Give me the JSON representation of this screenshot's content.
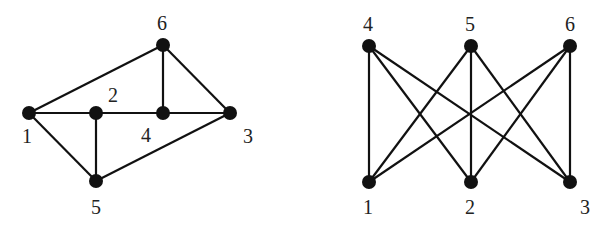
{
  "graphs": [
    {
      "id": "left",
      "nodes": [
        {
          "id": "1",
          "label": "1",
          "x": 29,
          "y": 113,
          "lx": 22,
          "ly": 143
        },
        {
          "id": "2",
          "label": "2",
          "x": 96,
          "y": 113,
          "lx": 108,
          "ly": 102
        },
        {
          "id": "3",
          "label": "3",
          "x": 230,
          "y": 113,
          "lx": 243,
          "ly": 143
        },
        {
          "id": "4",
          "label": "4",
          "x": 163,
          "y": 113,
          "lx": 141,
          "ly": 142
        },
        {
          "id": "5",
          "label": "5",
          "x": 96,
          "y": 181,
          "lx": 91,
          "ly": 214
        },
        {
          "id": "6",
          "label": "6",
          "x": 163,
          "y": 45,
          "lx": 157,
          "ly": 30
        }
      ],
      "edges": [
        [
          "1",
          "6"
        ],
        [
          "1",
          "2"
        ],
        [
          "2",
          "4"
        ],
        [
          "4",
          "3"
        ],
        [
          "6",
          "4"
        ],
        [
          "6",
          "3"
        ],
        [
          "1",
          "5"
        ],
        [
          "2",
          "5"
        ],
        [
          "5",
          "3"
        ]
      ]
    },
    {
      "id": "right",
      "nodes": [
        {
          "id": "4",
          "label": "4",
          "x": 369,
          "y": 46,
          "lx": 363,
          "ly": 31
        },
        {
          "id": "5",
          "label": "5",
          "x": 471,
          "y": 46,
          "lx": 465,
          "ly": 31
        },
        {
          "id": "6",
          "label": "6",
          "x": 570,
          "y": 46,
          "lx": 565,
          "ly": 31
        },
        {
          "id": "1",
          "label": "1",
          "x": 369,
          "y": 182,
          "lx": 363,
          "ly": 214
        },
        {
          "id": "2",
          "label": "2",
          "x": 471,
          "y": 182,
          "lx": 465,
          "ly": 214
        },
        {
          "id": "3",
          "label": "3",
          "x": 570,
          "y": 182,
          "lx": 580,
          "ly": 214
        }
      ],
      "edges": [
        [
          "4",
          "1"
        ],
        [
          "4",
          "2"
        ],
        [
          "4",
          "3"
        ],
        [
          "5",
          "1"
        ],
        [
          "5",
          "2"
        ],
        [
          "5",
          "3"
        ],
        [
          "6",
          "1"
        ],
        [
          "6",
          "2"
        ],
        [
          "6",
          "3"
        ]
      ]
    }
  ]
}
